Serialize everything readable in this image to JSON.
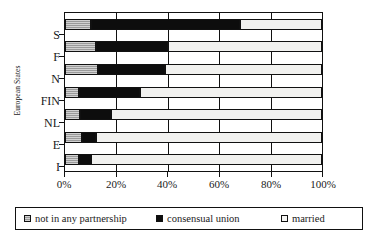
{
  "chart_data": {
    "type": "bar",
    "orientation": "horizontal",
    "stacked": true,
    "normalized_percent": true,
    "title": "",
    "xlabel": "",
    "ylabel": "European States",
    "categories": [
      "S",
      "F",
      "N",
      "FIN",
      "NL",
      "E",
      "I"
    ],
    "series": [
      {
        "name": "not in any partnership",
        "values": [
          10,
          12,
          13,
          5.5,
          6,
          6.5,
          5.5
        ],
        "color": "#9a9a9a"
      },
      {
        "name": "consensual union",
        "values": [
          58,
          28,
          26,
          23.5,
          12,
          5.5,
          4.5
        ],
        "color": "#0d0d0d"
      },
      {
        "name": "married",
        "values": [
          32,
          60,
          61,
          71,
          82,
          88,
          90
        ],
        "color": "#f1f1ef"
      }
    ],
    "cumulative_boundaries": [
      {
        "category": "S",
        "not_in_any_partnership_end": 10,
        "consensual_union_end": 68
      },
      {
        "category": "F",
        "not_in_any_partnership_end": 12,
        "consensual_union_end": 40
      },
      {
        "category": "N",
        "not_in_any_partnership_end": 13,
        "consensual_union_end": 39
      },
      {
        "category": "FIN",
        "not_in_any_partnership_end": 5.5,
        "consensual_union_end": 29
      },
      {
        "category": "NL",
        "not_in_any_partnership_end": 6,
        "consensual_union_end": 18
      },
      {
        "category": "E",
        "not_in_any_partnership_end": 6.5,
        "consensual_union_end": 12
      },
      {
        "category": "I",
        "not_in_any_partnership_end": 5.5,
        "consensual_union_end": 10
      }
    ],
    "xlim": [
      0,
      100
    ],
    "xticks": [
      0,
      20,
      40,
      60,
      80,
      100
    ],
    "xticklabels": [
      "0%",
      "20%",
      "40%",
      "60%",
      "80%",
      "100%"
    ],
    "grid": true,
    "grid_axis": "x",
    "legend_position": "bottom",
    "legend": [
      "not in any partnership",
      "consensual union",
      "married"
    ]
  }
}
